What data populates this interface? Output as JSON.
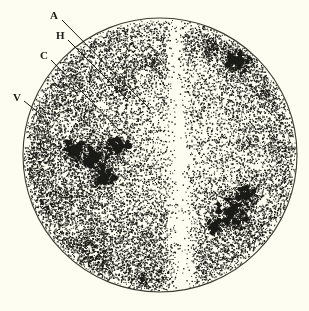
{
  "figure": {
    "kind": "circular-autoradiograph-micrograph",
    "background_color": "#fdfdf2",
    "ink_color": "#1a1a16",
    "outline_color": "#3a3a32",
    "caption": "",
    "circle": {
      "center_x": 160,
      "center_y": 155,
      "radius": 137,
      "outline_width": 1.1
    },
    "labels": [
      {
        "id": "label-a",
        "text": "A",
        "x": 50,
        "y": 10,
        "leader": {
          "x1": 62,
          "y1": 20,
          "x2": 150,
          "y2": 109
        }
      },
      {
        "id": "label-h",
        "text": "H",
        "x": 56,
        "y": 30,
        "leader": {
          "x1": 68,
          "y1": 40,
          "x2": 128,
          "y2": 100
        }
      },
      {
        "id": "label-c",
        "text": "C",
        "x": 40,
        "y": 50,
        "leader": {
          "x1": 51,
          "y1": 60,
          "x2": 120,
          "y2": 131
        }
      },
      {
        "id": "label-v",
        "text": "V",
        "x": 13,
        "y": 92,
        "leader": {
          "x1": 24,
          "y1": 101,
          "x2": 44,
          "y2": 117
        }
      }
    ],
    "features": {
      "cleft_label": "light vertical cleft",
      "cleft_x_center": 180,
      "cleft_width": 22,
      "dark_cluster_left": {
        "x": 95,
        "y": 160
      },
      "dark_cluster_lower_right": {
        "x": 232,
        "y": 212
      },
      "dark_band_top_right": {
        "x": 238,
        "y": 62
      }
    }
  }
}
